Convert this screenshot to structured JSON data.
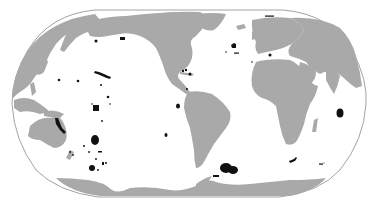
{
  "map": {
    "projection": "robinson-pacific-centered",
    "colors": {
      "background": "#ffffff",
      "ocean": "#ffffff",
      "land": "#a9a9a9",
      "outline": "#8a8a8a",
      "highlight": "#111111"
    },
    "highlighted_regions": [
      {
        "name": "aleutian-region",
        "cx": 124,
        "cy": 40,
        "rx": 2,
        "ry": 1.5
      },
      {
        "name": "gulf-of-alaska-region",
        "cx": 96,
        "cy": 41,
        "rx": 1.5,
        "ry": 1.5
      },
      {
        "name": "hawaii-chain",
        "shape": "chain"
      },
      {
        "name": "pacific-dot-1",
        "cx": 59,
        "cy": 80,
        "rx": 1.5,
        "ry": 1.5
      },
      {
        "name": "pacific-dot-2",
        "cx": 78,
        "cy": 81,
        "rx": 1.5,
        "ry": 1.5
      },
      {
        "name": "pacific-dot-3",
        "cx": 101,
        "cy": 85,
        "rx": 1.2,
        "ry": 1.2
      },
      {
        "name": "pacific-dot-4",
        "cx": 108,
        "cy": 97,
        "rx": 1.5,
        "ry": 1.5
      },
      {
        "name": "phoenix-islands-square",
        "x": 93,
        "y": 105,
        "w": 6,
        "h": 6
      },
      {
        "name": "central-pacific-dot",
        "cx": 103,
        "cy": 113,
        "rx": 1,
        "ry": 1
      },
      {
        "name": "galapagos-region",
        "cx": 178,
        "cy": 106,
        "rx": 2,
        "ry": 2.5
      },
      {
        "name": "coral-sea-strip",
        "shape": "strip"
      },
      {
        "name": "new-caledonia-region",
        "cx": 95,
        "cy": 140,
        "rx": 4,
        "ry": 5
      },
      {
        "name": "kermadec-region",
        "cx": 92,
        "cy": 168,
        "rx": 3,
        "ry": 3
      },
      {
        "name": "pitcairn-region",
        "cx": 166,
        "cy": 135,
        "rx": 1.5,
        "ry": 2
      },
      {
        "name": "south-georgia-large-1",
        "cx": 226,
        "cy": 168,
        "rx": 6,
        "ry": 5
      },
      {
        "name": "south-georgia-large-2",
        "cx": 233,
        "cy": 170,
        "rx": 5,
        "ry": 4
      },
      {
        "name": "south-orkney-region",
        "cx": 216,
        "cy": 176,
        "rx": 3,
        "ry": 1
      },
      {
        "name": "tristan-region",
        "cx": 293,
        "cy": 160,
        "rx": 4,
        "ry": 2
      },
      {
        "name": "prince-edward-region",
        "cx": 321,
        "cy": 164,
        "rx": 2.5,
        "ry": 1
      },
      {
        "name": "chagos-region",
        "cx": 340,
        "cy": 113,
        "rx": 3.5,
        "ry": 4.5
      },
      {
        "name": "azores-region",
        "cx": 234,
        "cy": 46,
        "rx": 3,
        "ry": 2.5
      },
      {
        "name": "madeira-region",
        "cx": 237,
        "cy": 53,
        "rx": 2.5,
        "ry": 0.8
      },
      {
        "name": "canary-dot",
        "cx": 252,
        "cy": 62,
        "rx": 0.8,
        "ry": 0.8
      },
      {
        "name": "mediterranean-dot",
        "cx": 270,
        "cy": 55,
        "rx": 1.5,
        "ry": 1.5
      },
      {
        "name": "svalbard-region",
        "cx": 269,
        "cy": 16,
        "rx": 5,
        "ry": 1
      },
      {
        "name": "caribbean-region",
        "cx": 184,
        "cy": 71,
        "rx": 3,
        "ry": 2
      },
      {
        "name": "florida-region",
        "cx": 190,
        "cy": 74,
        "rx": 2,
        "ry": 2
      },
      {
        "name": "central-america-dot",
        "cx": 187,
        "cy": 89,
        "rx": 1,
        "ry": 1
      }
    ]
  }
}
